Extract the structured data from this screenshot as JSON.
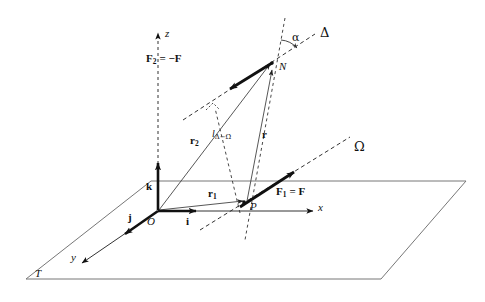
{
  "figure": {
    "background": "#ffffff",
    "ink": "#111111",
    "thin_line": "#555555",
    "width": 485,
    "height": 302
  },
  "axes": {
    "x": {
      "label": "x",
      "style": "solid-arrow"
    },
    "y": {
      "label": "y",
      "style": "solid-arrow"
    },
    "z": {
      "label": "z",
      "style": "dashed-arrow"
    },
    "origin": {
      "label": "O"
    }
  },
  "basis_vectors": [
    {
      "name": "i",
      "label": "i",
      "direction": "along x"
    },
    {
      "name": "j",
      "label": "j",
      "direction": "along y"
    },
    {
      "name": "k",
      "label": "k",
      "direction": "along z"
    }
  ],
  "points": [
    {
      "id": "O",
      "label": "O",
      "desc": "origin"
    },
    {
      "id": "P",
      "label": "P",
      "desc": "application point of F1 on line Omega"
    },
    {
      "id": "N",
      "label": "N",
      "desc": "application point of F2 on line Delta"
    }
  ],
  "lines": [
    {
      "id": "Delta",
      "label": "Δ",
      "style": "dashed",
      "desc": "action line of F2"
    },
    {
      "id": "Omega",
      "label": "Ω",
      "style": "dashed",
      "desc": "action line of F1"
    },
    {
      "id": "T",
      "label": "T",
      "style": "solid",
      "desc": "reference plane"
    }
  ],
  "vectors": [
    {
      "id": "F1",
      "label_main": "F",
      "label_sub": "1",
      "label_rhs": "= F",
      "full": "F1 = F",
      "from": "P",
      "style": "bold-arrow"
    },
    {
      "id": "F2",
      "label_main": "F",
      "label_sub": "2",
      "label_rhs": "= −F",
      "full": "F2 = −F",
      "from": "N",
      "style": "bold-arrow"
    },
    {
      "id": "r1",
      "label_main": "r",
      "label_sub": "1",
      "full": "r1",
      "from": "O",
      "to": "P",
      "style": "thin-arrow"
    },
    {
      "id": "r2",
      "label_main": "r",
      "label_sub": "2",
      "full": "r2",
      "from": "O",
      "to": "N",
      "style": "thin-arrow"
    },
    {
      "id": "r",
      "label_main": "r",
      "full": "r",
      "from": "P",
      "to": "N",
      "style": "thin-arrow"
    }
  ],
  "annotations": [
    {
      "id": "alpha",
      "label": "α",
      "desc": "angle between vertical dashed line at N and line Delta"
    },
    {
      "id": "l_delta_omega",
      "label_main": "l",
      "label_sub": "Δ−Ω",
      "full": "lΔ−Ω",
      "desc": "perpendicular distance between lines Delta and Omega"
    },
    {
      "id": "right-angle",
      "label": "",
      "desc": "right angle marker on perpendicular to Delta"
    }
  ]
}
